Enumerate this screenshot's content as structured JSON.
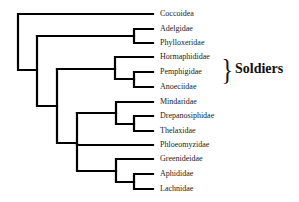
{
  "diagram": {
    "type": "phylogenetic-tree",
    "line_color": "#000000",
    "taxa": [
      {
        "label": "Coccoidea",
        "y": 14
      },
      {
        "label": "Adelgidae",
        "y": 29
      },
      {
        "label": "Phylloxeridae",
        "y": 43
      },
      {
        "label": "Hormaphididae",
        "y": 57
      },
      {
        "label": "Pemphigidae",
        "y": 72
      },
      {
        "label": "Anoeciidae",
        "y": 87
      },
      {
        "label": "Mindaridae",
        "y": 102
      },
      {
        "label": "Drepanosiphidae",
        "y": 116
      },
      {
        "label": "Thelaxidae",
        "y": 131
      },
      {
        "label": "Phloeomyzidae",
        "y": 145
      },
      {
        "label": "Greenideidae",
        "y": 159
      },
      {
        "label": "Aphididae",
        "y": 174
      },
      {
        "label": "Lachnidae",
        "y": 189
      }
    ],
    "group": {
      "brace": "}",
      "label": "Soldiers",
      "members": [
        "Hormaphididae",
        "Pemphigidae",
        "Anoeciidae"
      ]
    }
  }
}
